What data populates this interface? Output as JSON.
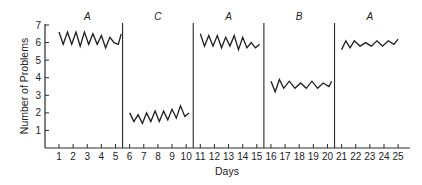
{
  "chart_data": {
    "type": "line",
    "title": "",
    "xlabel": "Days",
    "ylabel": "Number of Problems",
    "xlim": [
      0,
      25.5
    ],
    "ylim": [
      0,
      7
    ],
    "grid": false,
    "legend": null,
    "x_ticks": [
      1,
      2,
      3,
      4,
      5,
      6,
      7,
      8,
      9,
      10,
      11,
      12,
      13,
      14,
      15,
      16,
      17,
      18,
      19,
      20,
      21,
      22,
      23,
      24,
      25
    ],
    "y_ticks": [
      1,
      2,
      3,
      4,
      5,
      6,
      7
    ],
    "phase_dividers": [
      5.5,
      10.5,
      15.5,
      20.5
    ],
    "phases": [
      {
        "label": "A",
        "start": 1,
        "end": 5
      },
      {
        "label": "C",
        "start": 6,
        "end": 10
      },
      {
        "label": "A",
        "start": 11,
        "end": 15
      },
      {
        "label": "B",
        "start": 16,
        "end": 20
      },
      {
        "label": "A",
        "start": 21,
        "end": 25
      }
    ],
    "series": [
      {
        "name": "Phase A (baseline)",
        "x": [
          1.0,
          1.3,
          1.6,
          1.9,
          2.2,
          2.5,
          2.8,
          3.1,
          3.4,
          3.7,
          4.0,
          4.3,
          4.6,
          4.9,
          5.2,
          5.4
        ],
        "values": [
          6.6,
          5.9,
          6.6,
          5.9,
          6.6,
          5.8,
          6.6,
          5.9,
          6.5,
          5.9,
          6.4,
          5.7,
          6.3,
          6.0,
          5.9,
          6.5
        ]
      },
      {
        "name": "Phase C",
        "x": [
          6.0,
          6.3,
          6.6,
          6.9,
          7.2,
          7.5,
          7.8,
          8.1,
          8.4,
          8.7,
          9.0,
          9.3,
          9.6,
          9.9,
          10.2
        ],
        "values": [
          2.0,
          1.5,
          1.9,
          1.4,
          2.0,
          1.5,
          2.1,
          1.5,
          2.1,
          1.6,
          2.2,
          1.7,
          2.4,
          1.8,
          2.0
        ]
      },
      {
        "name": "Phase A (return)",
        "x": [
          11.0,
          11.3,
          11.6,
          11.9,
          12.2,
          12.5,
          12.8,
          13.1,
          13.4,
          13.7,
          14.0,
          14.3,
          14.6,
          14.9,
          15.2
        ],
        "values": [
          6.5,
          5.8,
          6.4,
          5.8,
          6.4,
          5.7,
          6.3,
          5.8,
          6.4,
          5.6,
          6.3,
          5.7,
          6.0,
          5.7,
          5.9
        ]
      },
      {
        "name": "Phase B",
        "x": [
          16.0,
          16.3,
          16.6,
          16.9,
          17.3,
          17.7,
          18.1,
          18.5,
          18.9,
          19.3,
          19.7,
          20.1,
          20.3
        ],
        "values": [
          3.8,
          3.2,
          3.9,
          3.4,
          3.8,
          3.4,
          3.7,
          3.4,
          3.8,
          3.4,
          3.7,
          3.5,
          3.8
        ]
      },
      {
        "name": "Phase A (final)",
        "x": [
          21.0,
          21.3,
          21.6,
          21.9,
          22.3,
          22.7,
          23.1,
          23.5,
          23.9,
          24.3,
          24.7,
          25.0
        ],
        "values": [
          5.6,
          6.1,
          5.7,
          6.1,
          5.8,
          6.0,
          5.8,
          6.1,
          5.8,
          6.1,
          5.9,
          6.2
        ]
      }
    ]
  }
}
